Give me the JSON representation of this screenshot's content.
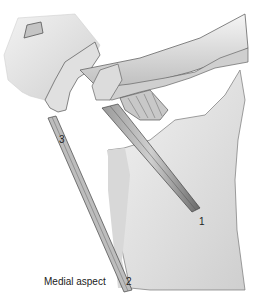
{
  "figure": {
    "caption": "Medial aspect",
    "labels": [
      {
        "id": "1",
        "text": "1"
      },
      {
        "id": "2",
        "text": "2"
      },
      {
        "id": "3",
        "text": "3"
      }
    ],
    "colors": {
      "bone_light": "#ececec",
      "bone_mid": "#cfcfcf",
      "outline": "#555555",
      "ligament_dark": "#6a6a6a",
      "background": "#ffffff"
    }
  }
}
